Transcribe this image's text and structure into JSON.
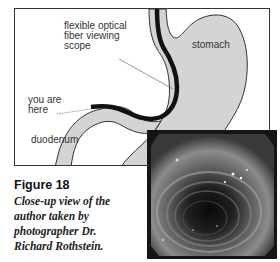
{
  "diagram": {
    "labels": {
      "scope": "flexible optical fiber viewing scope",
      "scope_lines": [
        "flexible optical",
        "fiber viewing",
        "scope"
      ],
      "stomach": "stomach",
      "you_are_here_lines": [
        "you are",
        "here"
      ],
      "duodenum": "duodenum"
    },
    "colors": {
      "organ_fill": "#d4d4d4",
      "organ_stroke": "#333333",
      "scope": "#111111",
      "frame_border": "#333333"
    }
  },
  "caption": {
    "title": "Figure 18",
    "lines": [
      "Close-up view of the",
      "author taken by",
      "photographer Dr.",
      "Richard Rothstein."
    ]
  },
  "photo": {
    "description": "endoscopic close-up of intestinal lumen"
  }
}
